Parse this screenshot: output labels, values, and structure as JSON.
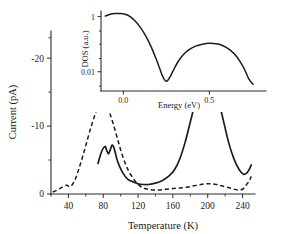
{
  "figure": {
    "background_color": "#ffffff",
    "line_color": "#1d1d1d"
  },
  "chart_data": [
    {
      "type": "line",
      "title": "",
      "xlabel": "Temperature (K)",
      "ylabel": "Current (pA)",
      "xlim": [
        20,
        252
      ],
      "ylim": [
        0,
        -24
      ],
      "y_inverted": true,
      "grid": false,
      "legend_position": "none",
      "xticks": [
        40,
        80,
        120,
        160,
        200,
        240
      ],
      "xtick_labels": [
        "40",
        "80",
        "120",
        "160",
        "200",
        "240"
      ],
      "xticks_minor": [
        20,
        60,
        100,
        140,
        180,
        220
      ],
      "yticks": [
        0,
        -10,
        -20
      ],
      "ytick_labels": [
        "0",
        "-10",
        "-20"
      ],
      "yticks_minor": [
        -5,
        -15,
        -23
      ],
      "series": [
        {
          "name": "solid",
          "style": "solid",
          "x": [
            74,
            78,
            82,
            84,
            86,
            88,
            90,
            92,
            94,
            96,
            99,
            103,
            108,
            114,
            120,
            126,
            132,
            140,
            148,
            156,
            162,
            168,
            174,
            180,
            186,
            192,
            198,
            202,
            206,
            212,
            218,
            224,
            230,
            236,
            241,
            245,
            248,
            250
          ],
          "y": [
            -4.5,
            -6.2,
            -7.0,
            -6.4,
            -5.9,
            -6.5,
            -7.2,
            -6.9,
            -6.0,
            -5.0,
            -4.0,
            -3.0,
            -2.2,
            -1.8,
            -1.5,
            -1.4,
            -1.4,
            -1.6,
            -2.0,
            -2.7,
            -3.6,
            -5.2,
            -7.6,
            -10.6,
            -13.6,
            -15.9,
            -17.0,
            -17.0,
            -16.3,
            -14.0,
            -10.8,
            -7.6,
            -5.2,
            -3.6,
            -2.9,
            -3.1,
            -3.7,
            -4.3
          ]
        },
        {
          "name": "dashed",
          "style": "dashed",
          "x": [
            22,
            26,
            30,
            34,
            38,
            41,
            44,
            48,
            52,
            57,
            62,
            67,
            72,
            76,
            80,
            84,
            88,
            92,
            96,
            100,
            105,
            110,
            116,
            122,
            128,
            136,
            144,
            152,
            160,
            168,
            176,
            184,
            192,
            198,
            204,
            210,
            216,
            222,
            228,
            234,
            240,
            244,
            248,
            250
          ],
          "y": [
            -0.3,
            -0.5,
            -0.8,
            -1.1,
            -1.3,
            -1.1,
            -1.3,
            -2.2,
            -3.7,
            -5.8,
            -8.1,
            -10.3,
            -12.2,
            -13.3,
            -13.6,
            -13.0,
            -11.7,
            -10.1,
            -8.3,
            -6.5,
            -4.6,
            -3.2,
            -2.0,
            -1.2,
            -0.8,
            -0.6,
            -0.6,
            -0.7,
            -0.8,
            -0.9,
            -1.0,
            -1.2,
            -1.4,
            -1.5,
            -1.5,
            -1.4,
            -1.2,
            -1.0,
            -0.8,
            -0.6,
            -0.7,
            -1.3,
            -2.0,
            -2.6
          ]
        }
      ]
    },
    {
      "type": "line",
      "inset": true,
      "title": "",
      "xlabel": "Energy (eV)",
      "ylabel": "DOS (a.u.)",
      "xlim": [
        -0.13,
        0.83
      ],
      "ylim": [
        0.002,
        1.6
      ],
      "yscale": "log",
      "grid": false,
      "legend_position": "none",
      "xticks": [
        0.0,
        0.5
      ],
      "xtick_labels": [
        "0.0",
        "0.5"
      ],
      "yticks": [
        1,
        0.01
      ],
      "ytick_labels": [
        "1",
        "0.01"
      ],
      "yticks_minor": [
        0.3,
        0.1,
        0.03,
        0.003
      ],
      "series": [
        {
          "name": "dos",
          "style": "solid",
          "x": [
            -0.105,
            -0.08,
            -0.05,
            -0.02,
            0.01,
            0.04,
            0.07,
            0.1,
            0.13,
            0.16,
            0.19,
            0.21,
            0.23,
            0.25,
            0.27,
            0.29,
            0.32,
            0.35,
            0.38,
            0.42,
            0.46,
            0.5,
            0.54,
            0.58,
            0.62,
            0.66,
            0.7,
            0.73,
            0.755
          ],
          "y": [
            1.05,
            1.2,
            1.3,
            1.3,
            1.22,
            1.0,
            0.68,
            0.4,
            0.2,
            0.085,
            0.03,
            0.014,
            0.0065,
            0.0045,
            0.0062,
            0.011,
            0.024,
            0.042,
            0.062,
            0.085,
            0.1,
            0.107,
            0.103,
            0.088,
            0.062,
            0.035,
            0.014,
            0.0055,
            0.0035
          ]
        }
      ]
    }
  ]
}
